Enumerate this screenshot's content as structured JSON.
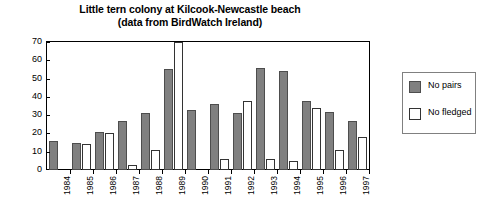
{
  "chart_data": {
    "type": "bar",
    "title": "Little tern colony at Kilcook-Newcastle beach\n(data from BirdWatch Ireland)",
    "title_line1": "Little tern colony at Kilcook-Newcastle beach",
    "title_line2": "(data from BirdWatch Ireland)",
    "xlabel": "",
    "ylabel": "",
    "ylim": [
      0,
      70
    ],
    "yticks": [
      0,
      10,
      20,
      30,
      40,
      50,
      60,
      70
    ],
    "grid": false,
    "legend_position": "right",
    "categories": [
      "1984",
      "1985",
      "1986",
      "1987",
      "1988",
      "1989",
      "1990",
      "1991",
      "1992",
      "1993",
      "1994",
      "1995",
      "1996",
      "1997"
    ],
    "series": [
      {
        "name": "No pairs",
        "color": "#808080",
        "values": [
          16,
          15,
          21,
          27,
          31,
          55,
          33,
          36,
          31,
          56,
          54,
          38,
          32,
          27
        ]
      },
      {
        "name": "No fledged",
        "color": "#ffffff",
        "values": [
          0,
          14,
          20,
          3,
          11,
          70,
          0,
          6,
          38,
          6,
          5,
          34,
          11,
          18
        ]
      }
    ]
  },
  "legend": {
    "items": [
      {
        "label": "No pairs",
        "swatch": "pairs"
      },
      {
        "label": "No fledged",
        "swatch": "fledged"
      }
    ]
  }
}
